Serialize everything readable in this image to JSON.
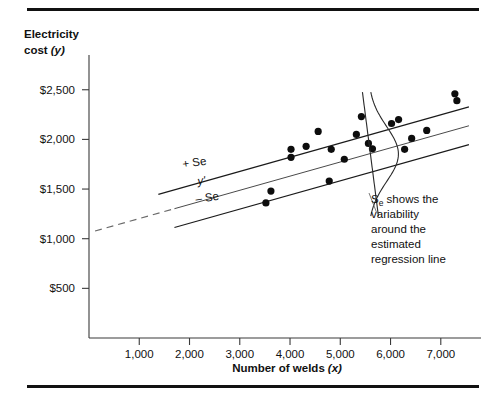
{
  "figure": {
    "top_rule": "horizontal-rule",
    "bottom_rule": "horizontal-rule"
  },
  "chart_data": {
    "type": "scatter",
    "title": "",
    "xlabel": "Number of welds (x)",
    "ylabel_line1": "Electricity",
    "ylabel_line2": "cost (y)",
    "xlim": [
      0,
      7800
    ],
    "ylim": [
      0,
      2850
    ],
    "xticks": [
      1000,
      2000,
      3000,
      4000,
      5000,
      6000,
      7000
    ],
    "xticklabels": [
      "1,000",
      "2,000",
      "3,000",
      "4,000",
      "5,000",
      "6,000",
      "7,000"
    ],
    "yticks": [
      500,
      1000,
      1500,
      2000,
      2500
    ],
    "yticklabels": [
      "$500",
      "$1,000",
      "$1,500",
      "$2,000",
      "$2,500"
    ],
    "grid": false,
    "legend_position": "inline-labels",
    "x": [
      3520,
      3620,
      4020,
      4020,
      4320,
      4560,
      4780,
      4820,
      5080,
      5320,
      5420,
      5560,
      5640,
      6020,
      6160,
      6280,
      6420,
      6720,
      7280,
      7320
    ],
    "y": [
      1360,
      1480,
      1900,
      1820,
      1930,
      2080,
      1580,
      1900,
      1800,
      2050,
      2230,
      1960,
      1905,
      2160,
      2200,
      1900,
      2010,
      2090,
      2460,
      2390
    ],
    "regression": {
      "label": "y'",
      "slope": 0.1425,
      "intercept": 1060,
      "x_solid_start": 1700,
      "x_end": 7560,
      "x_dash_start": 120
    },
    "bands": [
      {
        "label": "+ Se",
        "offset": 190,
        "x_start": 1380,
        "x_end": 7560
      },
      {
        "label": "– Se",
        "offset": -190,
        "x_start": 1700,
        "x_end": 7560
      }
    ],
    "annotation": {
      "lines": [
        "Sₑ shows the",
        "variability",
        "around the",
        "estimated",
        "regression line"
      ],
      "symbol_base": "S",
      "symbol_sub": "e",
      "rest_line1": " shows the",
      "description": "Se shows the variability around the estimated regression line"
    },
    "bell_curve": {
      "name": "normal-distribution-overlay",
      "center_x": 5560,
      "orientation": "vertical"
    },
    "colors": {
      "dot": "#0d0d0d",
      "band_line": "#1a1a1a",
      "regression_line": "#4a4a4a",
      "axis": "#3a3a3a",
      "rule": "#111111",
      "text": "#111111"
    }
  }
}
